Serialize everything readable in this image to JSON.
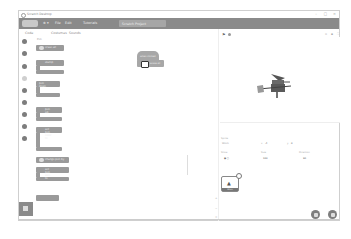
{
  "window": {
    "title": "Scratch Desktop",
    "controls": [
      "–",
      "□",
      "×"
    ]
  },
  "menubar": {
    "logo": "Scratch",
    "items": [
      "⊕ ▾",
      "File",
      "Edit",
      "Tutorials"
    ],
    "project_title": "Scratch Project"
  },
  "editor_tabs": [
    "Code",
    "Costumes",
    "Sounds"
  ],
  "categories": [
    {
      "label": "Motion",
      "light": false
    },
    {
      "label": "Looks",
      "light": false
    },
    {
      "label": "Sound",
      "light": false
    },
    {
      "label": "Events",
      "light": true
    },
    {
      "label": "Control",
      "light": false
    },
    {
      "label": "Sensing",
      "light": false
    },
    {
      "label": "Operators",
      "light": false
    },
    {
      "label": "Variables",
      "light": false
    },
    {
      "label": "My Blocks",
      "light": false
    }
  ],
  "palette": {
    "section": "Pen",
    "blocks": [
      {
        "label": "erase all"
      },
      {
        "label": "stamp"
      },
      {
        "label": "pen down"
      },
      {
        "label": "pen up"
      },
      {
        "label": "set pen color to"
      },
      {
        "label": "change pen by"
      },
      {
        "label": "set pen size to"
      }
    ]
  },
  "workspace": {
    "hat_label": "when clicked",
    "stack_label": "erase all",
    "zoom_buttons": [
      "+",
      "−",
      "="
    ]
  },
  "stage": {
    "header_icons": [
      "green-flag",
      "stop"
    ],
    "view_modes": [
      "small",
      "large",
      "fullscreen"
    ],
    "sprite_name": "Witch"
  },
  "sprite_info": {
    "sprite_label": "Sprite",
    "sprite_value": "Witch",
    "x_label": "x",
    "x_value": "-4",
    "y_label": "y",
    "y_value": "0",
    "show_label": "Show",
    "size_label": "Size",
    "size_value": "100",
    "direction_label": "Direction",
    "direction_value": "90"
  },
  "sprite_list": [
    {
      "name": "Witch",
      "selected": true
    }
  ],
  "colors": {
    "menubar": "#8a8a8a",
    "block": "#9a9a9a",
    "accent": "#7e7e7e"
  }
}
